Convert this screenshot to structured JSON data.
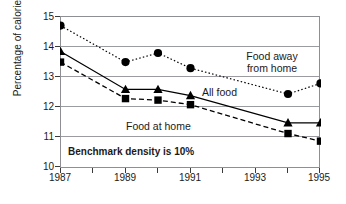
{
  "chart_data": {
    "type": "line",
    "title": "",
    "xlabel": "",
    "ylabel": "Percentage of calories",
    "xlim": [
      1987,
      1995
    ],
    "ylim": [
      10,
      15
    ],
    "grid": true,
    "legend_position": "inline-annotations",
    "x": [
      1987,
      1989,
      1990,
      1991,
      1994,
      1995
    ],
    "xticks": [
      1987,
      1989,
      1991,
      1993,
      1995
    ],
    "xtick_labels": [
      "1987",
      "1989",
      "1991",
      "1993",
      "1995"
    ],
    "xminorticks": [
      1988,
      1990,
      1992,
      1994
    ],
    "yticks": [
      10,
      11,
      12,
      13,
      14,
      15
    ],
    "ytick_labels": [
      "10",
      "11",
      "12",
      "13",
      "14",
      "15"
    ],
    "series": [
      {
        "name": "Food away from home",
        "marker": "circle",
        "linestyle": "dotted",
        "color": "#000000",
        "values": [
          14.7,
          13.5,
          13.8,
          13.3,
          12.45,
          12.8
        ]
      },
      {
        "name": "All food",
        "marker": "triangle",
        "linestyle": "solid",
        "color": "#000000",
        "values": [
          13.85,
          12.6,
          12.6,
          12.4,
          11.5,
          11.5
        ]
      },
      {
        "name": "Food at home",
        "marker": "square",
        "linestyle": "dashed",
        "color": "#000000",
        "values": [
          13.5,
          12.3,
          12.25,
          12.1,
          11.15,
          10.9
        ]
      }
    ],
    "annotations": [
      {
        "text": "Food away",
        "second_line": "from home",
        "bold": false
      },
      {
        "text": "All food",
        "bold": false
      },
      {
        "text": "Food at home",
        "bold": false
      },
      {
        "text": "Benchmark density is 10%",
        "bold": true
      }
    ]
  },
  "axis": {
    "y_title": "Percentage of calories"
  },
  "labels": {
    "food_away_line1": "Food away",
    "food_away_line2": "from home",
    "all_food": "All food",
    "food_at_home": "Food at home",
    "benchmark": "Benchmark density is 10%"
  },
  "ticks": {
    "y": [
      "15",
      "14",
      "13",
      "12",
      "11",
      "10"
    ],
    "x": [
      "1987",
      "1989",
      "1991",
      "1993",
      "1995"
    ]
  },
  "colors": {
    "line": "#000000",
    "grid": "#9a9c9f",
    "frame": "#8d8f92",
    "text": "#1a1a1a",
    "background": "#ffffff"
  }
}
